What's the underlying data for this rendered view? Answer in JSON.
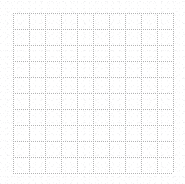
{
  "canvas": {
    "width": 185,
    "height": 184,
    "background_color": "#ffffff",
    "description": "blank white panel with a light gray dotted grid"
  },
  "grid": {
    "name": "dotted-grid",
    "line_color": "#b4b4b4",
    "line_style": "dotted",
    "line_width_px": 1,
    "dot_pitch_px": 2,
    "origin_x": 13,
    "origin_y": 13,
    "cell_width_px": 16,
    "cell_height_px": 16,
    "columns": 10,
    "rows": 10,
    "vertical_line_count": 11,
    "horizontal_line_count": 11,
    "width_px": 160,
    "height_px": 160,
    "right_edge_x": 173,
    "bottom_edge_y": 173,
    "vertical_line_positions": [
      13,
      29,
      45,
      61,
      77,
      93,
      109,
      125,
      141,
      157,
      173
    ],
    "horizontal_line_positions": [
      13,
      29,
      45,
      61,
      77,
      93,
      109,
      125,
      141,
      157,
      173
    ]
  },
  "texture": {
    "name": "jpeg-noise",
    "color": "#c8c8d0",
    "visible": true
  },
  "labels": {
    "title": "",
    "xlabel": "",
    "ylabel": "",
    "tick_labels_x": [],
    "tick_labels_y": [],
    "legend": []
  },
  "chart_data": {
    "type": "scatter",
    "title": "",
    "subtitle": "",
    "xlabel": "",
    "ylabel": "",
    "x": [],
    "y": [],
    "series": [],
    "categories": [],
    "values": [],
    "xlim": [
      0,
      10
    ],
    "ylim": [
      0,
      10
    ],
    "grid": true,
    "grid_style": "dotted",
    "grid_color": "#b4b4b4",
    "grid_x_ticks": [
      0,
      1,
      2,
      3,
      4,
      5,
      6,
      7,
      8,
      9,
      10
    ],
    "grid_y_ticks": [
      0,
      1,
      2,
      3,
      4,
      5,
      6,
      7,
      8,
      9,
      10
    ],
    "legend_position": "none",
    "note": "Empty plot area: only the dotted grid is drawn, no data marks, axes labels or ticks are rendered."
  }
}
